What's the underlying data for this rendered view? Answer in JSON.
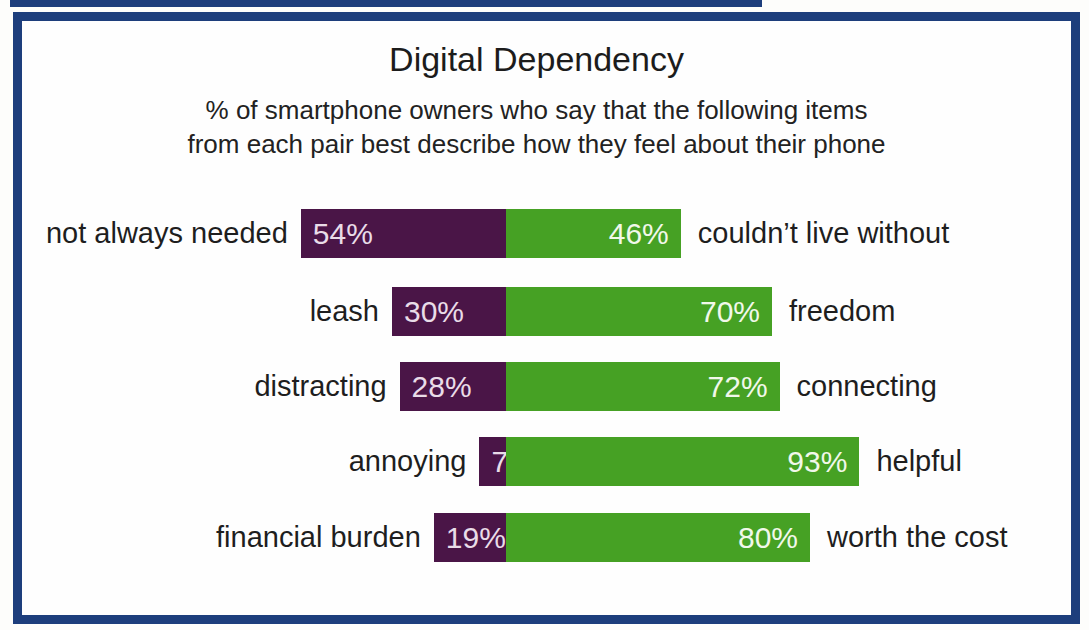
{
  "page": {
    "background": "#fdfdfb",
    "frame_border_color": "#1d3e7c",
    "scan_edge_artifact_color": "#1d3e7c"
  },
  "chart_data": {
    "type": "bar",
    "variant": "diverging-paired-horizontal",
    "title": "Digital Dependency",
    "subtitle_lines": [
      "% of smartphone owners who say that the following items",
      "from each pair best describe how they feel about their phone"
    ],
    "unit": "%",
    "value_range": [
      0,
      100
    ],
    "grid": false,
    "legend": "none",
    "series": [
      {
        "name": "negative descriptor",
        "color": "#4a1547",
        "value_text_color": "#e9dce8"
      },
      {
        "name": "positive descriptor",
        "color": "#46a124",
        "value_text_color": "#f1f8ea"
      }
    ],
    "rows": [
      {
        "left_label": "not always needed",
        "left_value": 54,
        "right_value": 46,
        "right_label": "couldn’t live without"
      },
      {
        "left_label": "leash",
        "left_value": 30,
        "right_value": 70,
        "right_label": "freedom"
      },
      {
        "left_label": "distracting",
        "left_value": 28,
        "right_value": 72,
        "right_label": "connecting"
      },
      {
        "left_label": "annoying",
        "left_value": 7,
        "right_value": 93,
        "right_label": "helpful"
      },
      {
        "left_label": "financial burden",
        "left_value": 19,
        "right_value": 80,
        "right_label": "worth the cost"
      }
    ],
    "layout": {
      "center_axis_x": 484,
      "px_per_percent": 3.8,
      "row_height": 49,
      "row_tops": [
        188,
        266,
        341,
        416,
        492
      ],
      "label_gap_left": 13,
      "label_gap_right": 17
    }
  }
}
